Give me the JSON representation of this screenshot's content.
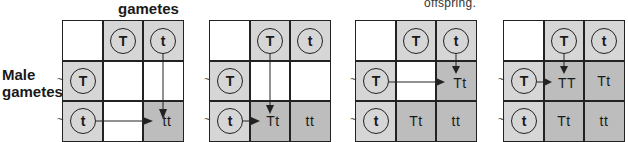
{
  "labels": {
    "female_gametes": "gametes",
    "male_gametes_line1": "Male",
    "male_gametes_line2": "gametes",
    "caption_fragment": "offspring."
  },
  "colors": {
    "grid_line": "#222222",
    "gamete_cell": "#d6d6d6",
    "offspring_cell": "#bdbdbd",
    "empty_cell": "#ffffff"
  },
  "gametes": {
    "top": [
      "T",
      "t"
    ],
    "left": [
      "T",
      "t"
    ]
  },
  "grids": [
    {
      "step": 1,
      "cells": [
        [
          "",
          ""
        ],
        [
          "",
          "tt"
        ]
      ],
      "filled": [
        [
          false,
          false
        ],
        [
          false,
          true
        ]
      ]
    },
    {
      "step": 2,
      "cells": [
        [
          "",
          ""
        ],
        [
          "Tt",
          "tt"
        ]
      ],
      "filled": [
        [
          false,
          false
        ],
        [
          true,
          true
        ]
      ]
    },
    {
      "step": 3,
      "cells": [
        [
          "",
          "Tt"
        ],
        [
          "Tt",
          "tt"
        ]
      ],
      "filled": [
        [
          false,
          true
        ],
        [
          true,
          true
        ]
      ]
    },
    {
      "step": 4,
      "cells": [
        [
          "TT",
          "Tt"
        ],
        [
          "Tt",
          "tt"
        ]
      ],
      "filled": [
        [
          true,
          true
        ],
        [
          true,
          true
        ]
      ]
    }
  ]
}
